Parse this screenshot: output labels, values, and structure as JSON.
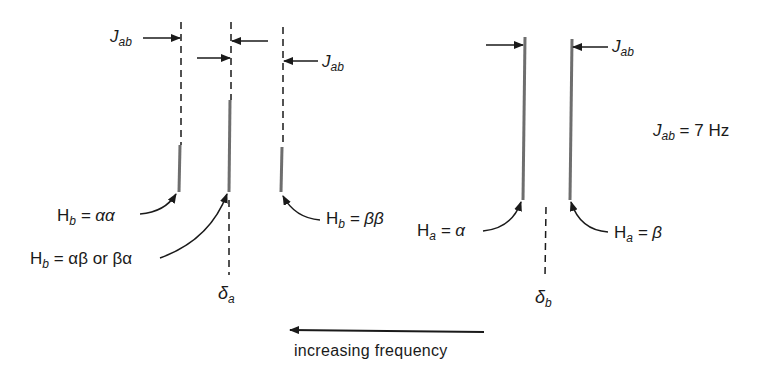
{
  "diagram": {
    "coupling_constant": {
      "symbol": "J",
      "subscript": "ab",
      "equals": "= 7 Hz"
    },
    "coupling_arrow_label": {
      "symbol": "J",
      "subscript": "ab"
    },
    "peaks_a": {
      "label_center": {
        "symbol": "δ",
        "subscript": "a"
      },
      "lines": [
        {
          "label_H": "H",
          "label_sub": "b",
          "label_eq": "= αα"
        },
        {
          "label_H": "H",
          "label_sub": "b",
          "label_eq": "= αβ or βα"
        },
        {
          "label_H": "H",
          "label_sub": "b",
          "label_eq": "= ββ"
        }
      ]
    },
    "peaks_b": {
      "label_center": {
        "symbol": "δ",
        "subscript": "b"
      },
      "lines": [
        {
          "label_H": "H",
          "label_sub": "a",
          "label_eq": "= α"
        },
        {
          "label_H": "H",
          "label_sub": "a",
          "label_eq": "= β"
        }
      ]
    },
    "frequency_caption": "increasing frequency",
    "colors": {
      "solid_line": "#6e6e6e",
      "ink": "#1a1a1a"
    }
  }
}
